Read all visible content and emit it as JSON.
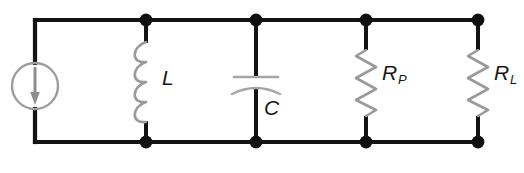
{
  "figure": {
    "type": "electrical-schematic",
    "width": 524,
    "height": 173,
    "background_color": "#ffffff",
    "wire_color": "#131313",
    "component_color": "#9a9a9a",
    "label_color": "#181818"
  },
  "rails": {
    "top_y": 20,
    "bottom_y": 142,
    "left_x": 35,
    "right_x": 478
  },
  "nodes": [
    {
      "name": "node-top-inductor",
      "x": 146,
      "y": 20,
      "radius": 6.4
    },
    {
      "name": "node-top-capacitor",
      "x": 256,
      "y": 20,
      "radius": 6.4
    },
    {
      "name": "node-top-rp",
      "x": 366,
      "y": 20,
      "radius": 6.4
    },
    {
      "name": "node-top-rl",
      "x": 478,
      "y": 20,
      "radius": 6.4
    },
    {
      "name": "node-bottom-inductor",
      "x": 146,
      "y": 142,
      "radius": 6.4
    },
    {
      "name": "node-bottom-capacitor",
      "x": 256,
      "y": 142,
      "radius": 6.4
    },
    {
      "name": "node-bottom-rp",
      "x": 366,
      "y": 142,
      "radius": 6.4
    },
    {
      "name": "node-bottom-rl",
      "x": 478,
      "y": 142,
      "radius": 6.4
    }
  ],
  "components": [
    {
      "id": "current-source",
      "kind": "current-source",
      "symbol": "circle-with-down-arrow",
      "label": "",
      "x": 35,
      "cy": 86,
      "radius": 23,
      "arrow_direction": "down"
    },
    {
      "id": "inductor",
      "kind": "inductor",
      "symbol": "coil",
      "label": "L",
      "subscript": "",
      "x": 146,
      "y_top": 42,
      "y_bottom": 122,
      "turns": 4,
      "label_x": 162,
      "label_y": 67
    },
    {
      "id": "capacitor",
      "kind": "capacitor",
      "symbol": "plate-and-curve",
      "label": "C",
      "subscript": "",
      "x": 256,
      "plate_y": 77,
      "curve_y": 87,
      "plate_half_width": 22,
      "label_x": 264,
      "label_y": 97
    },
    {
      "id": "resistor-p",
      "kind": "resistor",
      "symbol": "zigzag",
      "label": "R",
      "subscript": "P",
      "x": 366,
      "y_top": 50,
      "y_bottom": 116,
      "zigs": 6,
      "label_x": 382,
      "label_y": 62
    },
    {
      "id": "resistor-l",
      "kind": "resistor",
      "symbol": "zigzag",
      "label": "R",
      "subscript": "L",
      "x": 478,
      "y_top": 50,
      "y_bottom": 116,
      "zigs": 6,
      "label_x": 494,
      "label_y": 62
    }
  ],
  "labels": {
    "inductor": {
      "base": "L",
      "sub": ""
    },
    "capacitor": {
      "base": "C",
      "sub": ""
    },
    "resistor_p": {
      "base": "R",
      "sub": "P"
    },
    "resistor_l": {
      "base": "R",
      "sub": "L"
    }
  }
}
